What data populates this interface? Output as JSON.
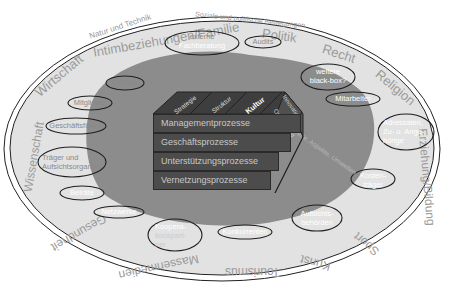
{
  "colors": {
    "background": "#ffffff",
    "outer_ring": "#e2e2e2",
    "inner_region": "#8c8c8c",
    "box_face": "#4c4c4c",
    "box_top": "#3e3e3e",
    "box_side": "#555555",
    "ring_text": "#9a9a9a",
    "bubble_text_light": "#ffffff",
    "bubble_text_dark": "#a0a0a0",
    "outline": "#1e1e1e"
  },
  "outer_labels": {
    "natur_technik": "Natur und Technik",
    "soziale_bewegungen": "Soziale und politische Bewegungen",
    "intimbeziehungen": "Intimbeziehungen/Familie",
    "politik": "Politik",
    "recht": "Recht",
    "religion": "Religion",
    "erziehung": "Erziehung/Bildung",
    "sport": "Sport",
    "kunst": "Kunst",
    "tourismus": "Tourismus",
    "massenmedien": "Massenmedien",
    "gesundheit": "Gesundheit",
    "wissenschaft": "Wissenschaft",
    "wirtschaft": "Wirtschaft"
  },
  "bubbles": [
    {
      "id": "externe-fachberatung",
      "lines": [
        "externe",
        "Fachberatung"
      ]
    },
    {
      "id": "audits",
      "lines": [
        "Audits"
      ]
    },
    {
      "id": "weitere-black-box",
      "lines": [
        "weitere",
        "black-box?"
      ]
    },
    {
      "id": "politiker",
      "lines": [
        "Politiker"
      ]
    },
    {
      "id": "mitglieder",
      "lines": [
        "Mitglieder"
      ]
    },
    {
      "id": "mitarbeiter",
      "lines": [
        "Mitarbeiter"
      ]
    },
    {
      "id": "geschaeftsfuehrer",
      "lines": [
        "Geschäftsführer"
      ]
    },
    {
      "id": "traeger-aufsichtsorgane",
      "lines": [
        "Träger und",
        "Aufsichtsorgane"
      ]
    },
    {
      "id": "adressaten",
      "lines": [
        "Adressaten,",
        "Zu- u. Ange-",
        "hörige"
      ]
    },
    {
      "id": "beiraete",
      "lines": [
        "Beiräte"
      ]
    },
    {
      "id": "kostentraeger",
      "lines": [
        "Kosten-",
        "träger"
      ]
    },
    {
      "id": "netzwerke",
      "lines": [
        "Netzwerke"
      ]
    },
    {
      "id": "kooperationspartner",
      "lines": [
        "Koopera-",
        "tionspart-",
        "ner"
      ]
    },
    {
      "id": "konkurrenten",
      "lines": [
        "Konkurrenten"
      ]
    },
    {
      "id": "aufsichtsbehoerden",
      "lines": [
        "Aufsichts-",
        "behörden"
      ]
    }
  ],
  "inner_arc_text": "Normen, Werte, Aspekte, Umwelten",
  "box": {
    "top_labels": [
      "Strategie",
      "Struktur",
      "Kultur"
    ],
    "side_labels": [
      "Innovation",
      "Optimierung"
    ],
    "rows": [
      "Managementprozesse",
      "Geschäftsprozesse",
      "Unterstützungsprozesse",
      "Vernetzungsprozesse"
    ]
  }
}
